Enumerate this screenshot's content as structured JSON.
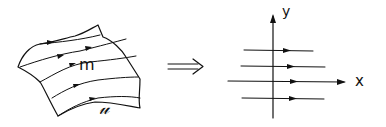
{
  "diagram": {
    "left_panel": {
      "description": "curved surface with flow lines (foliation)",
      "label_inner": "m",
      "label_outer": "𝓊",
      "flow_line_count": 5
    },
    "connector": {
      "symbol": "implies-arrow"
    },
    "right_panel": {
      "description": "straightened horizontal flow lines in coordinate axes",
      "axis_y_label": "y",
      "axis_x_label": "x",
      "flow_line_count": 4
    }
  }
}
